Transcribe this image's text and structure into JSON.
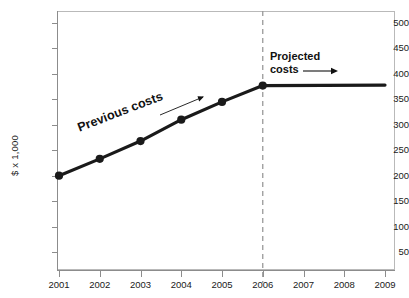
{
  "chart_data": {
    "type": "line",
    "title": "",
    "xlabel": "",
    "ylabel": "$ x 1,000",
    "x": [
      2001,
      2002,
      2003,
      2004,
      2005,
      2006,
      2007,
      2008,
      2009
    ],
    "xtick_labels": [
      "2001",
      "2002",
      "2003",
      "2004",
      "2005",
      "2006",
      "2007",
      "2008",
      "2009"
    ],
    "xlim": [
      2001,
      2009
    ],
    "ylim": [
      0,
      520
    ],
    "ytick_values": [
      50,
      100,
      150,
      200,
      250,
      300,
      350,
      400,
      450,
      500
    ],
    "ytick_labels": [
      "50",
      "100",
      "150",
      "200",
      "250",
      "300",
      "350",
      "400",
      "450",
      "500"
    ],
    "grid": false,
    "legend": "none",
    "series": [
      {
        "name": "Previous costs",
        "style": "solid-thick-with-markers",
        "color": "#1a1a1a",
        "x": [
          2001,
          2002,
          2003,
          2004,
          2005,
          2006
        ],
        "values": [
          200,
          233,
          268,
          310,
          345,
          377
        ]
      },
      {
        "name": "Projected costs",
        "style": "solid-thick",
        "color": "#1a1a1a",
        "x": [
          2006,
          2009
        ],
        "values": [
          377,
          378
        ]
      }
    ],
    "annotations": [
      {
        "name": "previous-costs",
        "text": "Previous costs",
        "rotation": -21,
        "arrow": "up-right"
      },
      {
        "name": "projected-costs",
        "line1": "Projected",
        "line2": "costs",
        "arrow": "right"
      },
      {
        "name": "forecast-divider",
        "text": "",
        "at_x": 2006,
        "style": "dashed-vertical",
        "color": "#9a9a9a"
      }
    ]
  },
  "axes": {
    "y_title": "$ x 1,000"
  },
  "annotations": {
    "previous_costs": "Previous costs",
    "projected_line1": "Projected",
    "projected_line2": "costs"
  }
}
